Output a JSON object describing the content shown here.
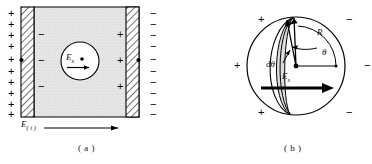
{
  "figure": {
    "panels": [
      {
        "id": "a",
        "caption": "( a )",
        "description": "parallel-plate capacitor with dielectric and spherical cavity",
        "field_label": {
          "symbol": "E",
          "subscript": "( i )"
        },
        "cavity_label": {
          "symbol": "E",
          "subscript": "s"
        },
        "left_plate": {
          "outside_sign": "+",
          "outside_count": 10,
          "inside_sign": "−",
          "inside_count": 3
        },
        "right_plate": {
          "outside_sign": "−",
          "outside_count": 10,
          "inside_sign": "+",
          "inside_count": 3
        }
      },
      {
        "id": "b",
        "caption": "( b )",
        "description": "spherical cavity showing radius, polar angle and surface-charge element",
        "labels": {
          "radius": "R",
          "angle": "θ",
          "angle_element": {
            "prefix": "d",
            "symbol": "θ"
          },
          "field": {
            "symbol": "E",
            "subscript": "s"
          }
        },
        "left_signs": [
          "+",
          "+",
          "+"
        ],
        "right_signs": [
          "−",
          "−",
          "−"
        ]
      }
    ]
  },
  "colors": {
    "ink": "#000000",
    "background": "#ffffff",
    "dielectric_fill": "#e3e3e3",
    "strip_fill": "#d8d8d8",
    "plate_fill": "#ffffff"
  }
}
